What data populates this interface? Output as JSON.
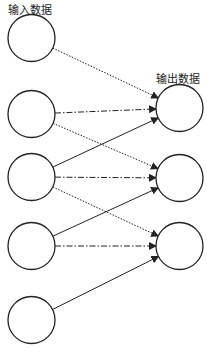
{
  "labels": {
    "input": "输入数据",
    "output": "输出数据"
  },
  "layers": {
    "input": {
      "nodes": 5
    },
    "output": {
      "nodes": 3
    }
  },
  "connections": [
    {
      "from": 0,
      "to": 0,
      "style": "dotted"
    },
    {
      "from": 1,
      "to": 0,
      "style": "dashdot"
    },
    {
      "from": 1,
      "to": 1,
      "style": "dotted"
    },
    {
      "from": 2,
      "to": 0,
      "style": "solid"
    },
    {
      "from": 2,
      "to": 1,
      "style": "dashdot"
    },
    {
      "from": 2,
      "to": 2,
      "style": "dotted"
    },
    {
      "from": 3,
      "to": 1,
      "style": "solid"
    },
    {
      "from": 3,
      "to": 2,
      "style": "dashdot"
    },
    {
      "from": 4,
      "to": 2,
      "style": "solid"
    }
  ],
  "colors": {
    "stroke": "#222222"
  }
}
